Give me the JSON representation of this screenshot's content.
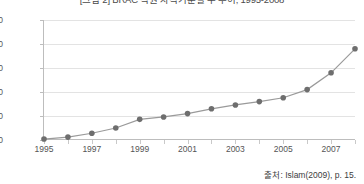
{
  "chart_data": {
    "type": "line",
    "title": "[그림 2] BRAC 직원 자격기준별 수 추이, 1995-2008",
    "xlabel": "",
    "ylabel": "",
    "x": [
      1995,
      1996,
      1997,
      1998,
      1999,
      2000,
      2001,
      2002,
      2003,
      2004,
      2005,
      2006,
      2007,
      2008
    ],
    "series": [
      {
        "name": "BRAC 직원 수",
        "values": [
          20,
          60,
          140,
          250,
          430,
          480,
          550,
          650,
          730,
          800,
          880,
          1050,
          1400,
          1900
        ]
      }
    ],
    "xlim": [
      1995,
      2008
    ],
    "ylim": [
      0,
      2500
    ],
    "ytick_labels": [
      "0",
      "500",
      "1000",
      "1500",
      "2000",
      "2500"
    ],
    "ytick_values": [
      0,
      500,
      1000,
      1500,
      2000,
      2500
    ],
    "xtick_labels": [
      "1995",
      "1997",
      "1999",
      "2001",
      "2003",
      "2005",
      "2007"
    ],
    "xtick_values": [
      1995,
      1997,
      1999,
      2001,
      2003,
      2005,
      2007
    ],
    "grid": true,
    "legend": "none",
    "marker": "circle",
    "line_color": "#9a9a9a",
    "marker_color": "#6e6e6e",
    "grid_color": "#e3e3e3"
  },
  "source": {
    "text": "출처: Islam(2009), p. 15."
  }
}
